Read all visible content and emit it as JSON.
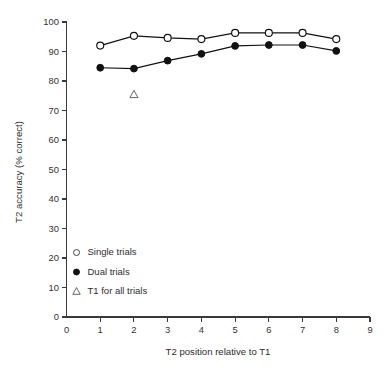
{
  "chart_data": {
    "type": "line",
    "title": "",
    "xlabel": "T2 position relative to T1",
    "ylabel": "T2 accuracy (% correct)",
    "xlim": [
      0,
      9
    ],
    "ylim": [
      0,
      100
    ],
    "grid": false,
    "legend_position": "inside-lower-left",
    "x": [
      1,
      2,
      3,
      4,
      5,
      6,
      7,
      8
    ],
    "xticks": [
      "0",
      "1",
      "2",
      "3",
      "4",
      "5",
      "6",
      "7",
      "8",
      "9"
    ],
    "xtick_values": [
      0,
      1,
      2,
      3,
      4,
      5,
      6,
      7,
      8,
      9
    ],
    "yticks": [
      "0",
      "10",
      "20",
      "30",
      "40",
      "50",
      "60",
      "70",
      "80",
      "90",
      "100"
    ],
    "ytick_values": [
      0,
      10,
      20,
      30,
      40,
      50,
      60,
      70,
      80,
      90,
      100
    ],
    "series": [
      {
        "name": "Single trials",
        "marker": "open-circle",
        "x": [
          1,
          2,
          3,
          4,
          5,
          6,
          7,
          8
        ],
        "values": [
          92.0,
          95.3,
          94.6,
          94.2,
          96.3,
          96.3,
          96.3,
          94.2
        ]
      },
      {
        "name": "Dual trials",
        "marker": "filled-circle",
        "x": [
          1,
          2,
          3,
          4,
          5,
          6,
          7,
          8
        ],
        "values": [
          84.5,
          84.2,
          86.9,
          89.2,
          91.9,
          92.2,
          92.2,
          90.2
        ]
      },
      {
        "name": "T1 for all trials",
        "marker": "open-triangle",
        "x": [
          2
        ],
        "values": [
          75.4
        ]
      }
    ],
    "colors": {
      "line": "#111111",
      "axis": "#3a3a3a",
      "text": "#2e2e2e",
      "background": "#ffffff",
      "marker_fill_open": "#ffffff",
      "marker_fill_closed": "#111111"
    }
  },
  "legend": {
    "items": [
      {
        "label": "Single trials",
        "marker": "open-circle-icon"
      },
      {
        "label": "Dual trials",
        "marker": "filled-circle-icon"
      },
      {
        "label": "T1 for all trials",
        "marker": "open-triangle-icon"
      }
    ]
  }
}
